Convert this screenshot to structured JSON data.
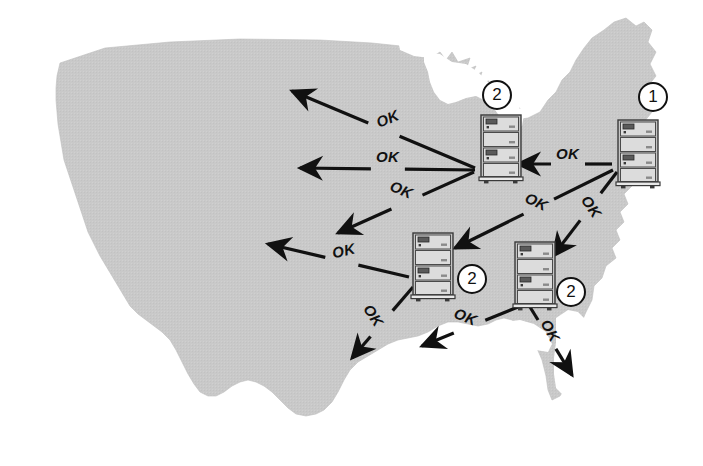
{
  "diagram": {
    "colors": {
      "map_fill": "#c9c9c9",
      "ink": "#111111",
      "server_body": "#d4d4d4",
      "server_light": "#eeeeee",
      "badge_fill": "#ffffff"
    }
  },
  "servers": [
    {
      "id": "server-1",
      "icon": "server-rack-icon",
      "badge": "1",
      "region": "east-coast",
      "x": 615,
      "y": 118,
      "badge_x": 638,
      "badge_y": 82
    },
    {
      "id": "server-2-great-lakes",
      "icon": "server-rack-icon",
      "badge": "2",
      "region": "great-lakes",
      "x": 478,
      "y": 113,
      "badge_x": 482,
      "badge_y": 80
    },
    {
      "id": "server-2-central",
      "icon": "server-rack-icon",
      "badge": "2",
      "region": "central",
      "x": 410,
      "y": 231,
      "badge_x": 457,
      "badge_y": 264
    },
    {
      "id": "server-2-southeast",
      "icon": "server-rack-icon",
      "badge": "2",
      "region": "southeast",
      "x": 512,
      "y": 240,
      "badge_x": 556,
      "badge_y": 277
    }
  ],
  "arrows": [
    {
      "id": "arrow-gl-northwest",
      "label": "OK",
      "from": "server-2-great-lakes",
      "x1": 475,
      "y1": 168,
      "x2": 292,
      "y2": 91,
      "label_x": 388,
      "label_y": 120,
      "label_rot": -23
    },
    {
      "id": "arrow-gl-west",
      "label": "OK",
      "from": "server-2-great-lakes",
      "x1": 475,
      "y1": 170,
      "x2": 300,
      "y2": 168,
      "label_x": 388,
      "label_y": 158,
      "label_rot": 0
    },
    {
      "id": "arrow-gl-southwest",
      "label": "OK",
      "from": "server-2-great-lakes",
      "x1": 474,
      "y1": 172,
      "x2": 338,
      "y2": 233,
      "label_x": 402,
      "label_y": 191,
      "label_rot": 23
    },
    {
      "id": "arrow-s1-to-gl",
      "label": "OK",
      "from": "server-1",
      "x1": 612,
      "y1": 164,
      "x2": 518,
      "y2": 164,
      "label_x": 568,
      "label_y": 155,
      "label_rot": 0
    },
    {
      "id": "arrow-s1-to-central",
      "label": "OK",
      "from": "server-1",
      "x1": 613,
      "y1": 170,
      "x2": 455,
      "y2": 248,
      "label_x": 537,
      "label_y": 203,
      "label_rot": 26
    },
    {
      "id": "arrow-s1-to-southeast",
      "label": "OK",
      "from": "server-1",
      "x1": 617,
      "y1": 172,
      "x2": 553,
      "y2": 256,
      "label_x": 592,
      "label_y": 208,
      "label_rot": 56
    },
    {
      "id": "arrow-central-west",
      "label": "OK",
      "from": "server-2-central",
      "x1": 409,
      "y1": 277,
      "x2": 268,
      "y2": 244,
      "label_x": 344,
      "label_y": 252,
      "label_rot": -13
    },
    {
      "id": "arrow-central-southwest",
      "label": "OK",
      "from": "server-2-central",
      "x1": 413,
      "y1": 287,
      "x2": 352,
      "y2": 358,
      "label_x": 374,
      "label_y": 317,
      "label_rot": 57
    },
    {
      "id": "arrow-se-west",
      "label": "OK",
      "from": "server-2-southeast",
      "x1": 518,
      "y1": 307,
      "x2": 422,
      "y2": 346,
      "label_x": 466,
      "label_y": 318,
      "label_rot": 22
    },
    {
      "id": "arrow-se-southeast",
      "label": "OK",
      "from": "server-2-southeast",
      "x1": 530,
      "y1": 307,
      "x2": 572,
      "y2": 375,
      "label_x": 551,
      "label_y": 332,
      "label_rot": 62
    }
  ]
}
